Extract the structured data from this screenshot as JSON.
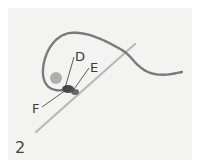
{
  "figure": {
    "step_number": "2",
    "labels": {
      "d": "D",
      "e": "E",
      "f": "F"
    },
    "colors": {
      "background": "#f3f3f2",
      "thread": "#7a7a7a",
      "needle": "#b5b5b5",
      "knot": "#4a4a4a",
      "text": "#3a3a3a"
    }
  }
}
